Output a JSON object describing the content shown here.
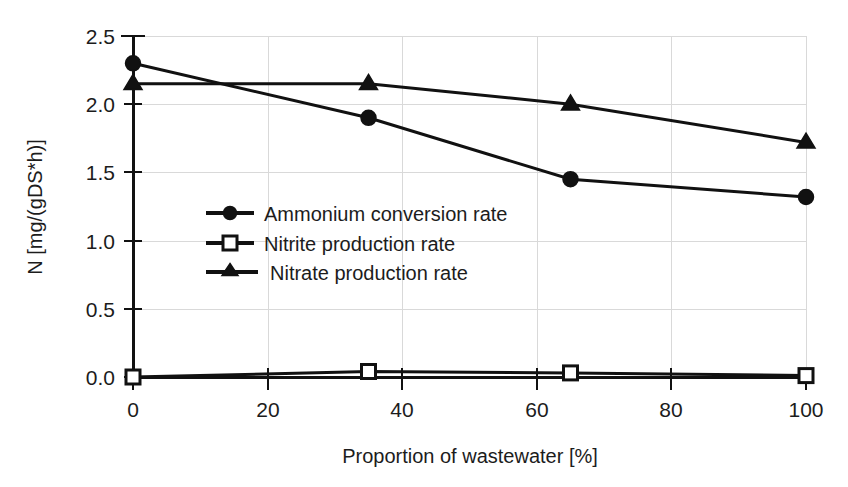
{
  "chart_data": {
    "type": "line",
    "title": "",
    "xlabel": "Proportion of wastewater [%]",
    "ylabel": "N [mg/(gDS*h)]",
    "x": [
      0,
      35,
      65,
      100
    ],
    "xlim": [
      0,
      100
    ],
    "ylim": [
      0.0,
      2.5
    ],
    "xticks": [
      "0",
      "20",
      "40",
      "60",
      "80",
      "100"
    ],
    "xtick_values": [
      0,
      20,
      40,
      60,
      80,
      100
    ],
    "yticks": [
      "0.0",
      "0.5",
      "1.0",
      "1.5",
      "2.0",
      "2.5"
    ],
    "ytick_values": [
      0.0,
      0.5,
      1.0,
      1.5,
      2.0,
      2.5
    ],
    "grid": "both",
    "legend_position": "center-left-inside",
    "series": [
      {
        "name": "Ammonium conversion rate",
        "marker": "filled-circle",
        "color": "#111111",
        "values": [
          2.3,
          1.9,
          1.45,
          1.32
        ]
      },
      {
        "name": "Nitrite production rate",
        "marker": "open-square",
        "color": "#111111",
        "values": [
          0.0,
          0.04,
          0.03,
          0.01
        ]
      },
      {
        "name": "Nitrate production rate",
        "marker": "filled-triangle",
        "color": "#111111",
        "values": [
          2.15,
          2.15,
          2.0,
          1.72
        ]
      }
    ]
  },
  "axes": {
    "y_title": "N [mg/(gDS*h)]",
    "x_title": "Proportion of wastewater [%]",
    "y_tick_0": "0.0",
    "y_tick_1": "0.5",
    "y_tick_2": "1.0",
    "y_tick_3": "1.5",
    "y_tick_4": "2.0",
    "y_tick_5": "2.5",
    "x_tick_0": "0",
    "x_tick_1": "20",
    "x_tick_2": "40",
    "x_tick_3": "60",
    "x_tick_4": "80",
    "x_tick_5": "100"
  },
  "legend": {
    "item_0": "Ammonium conversion rate",
    "item_1": "Nitrite production rate",
    "item_2": "Nitrate production rate"
  },
  "colors": {
    "ink": "#111111",
    "grid": "#d9d9d9",
    "background": "#ffffff"
  }
}
